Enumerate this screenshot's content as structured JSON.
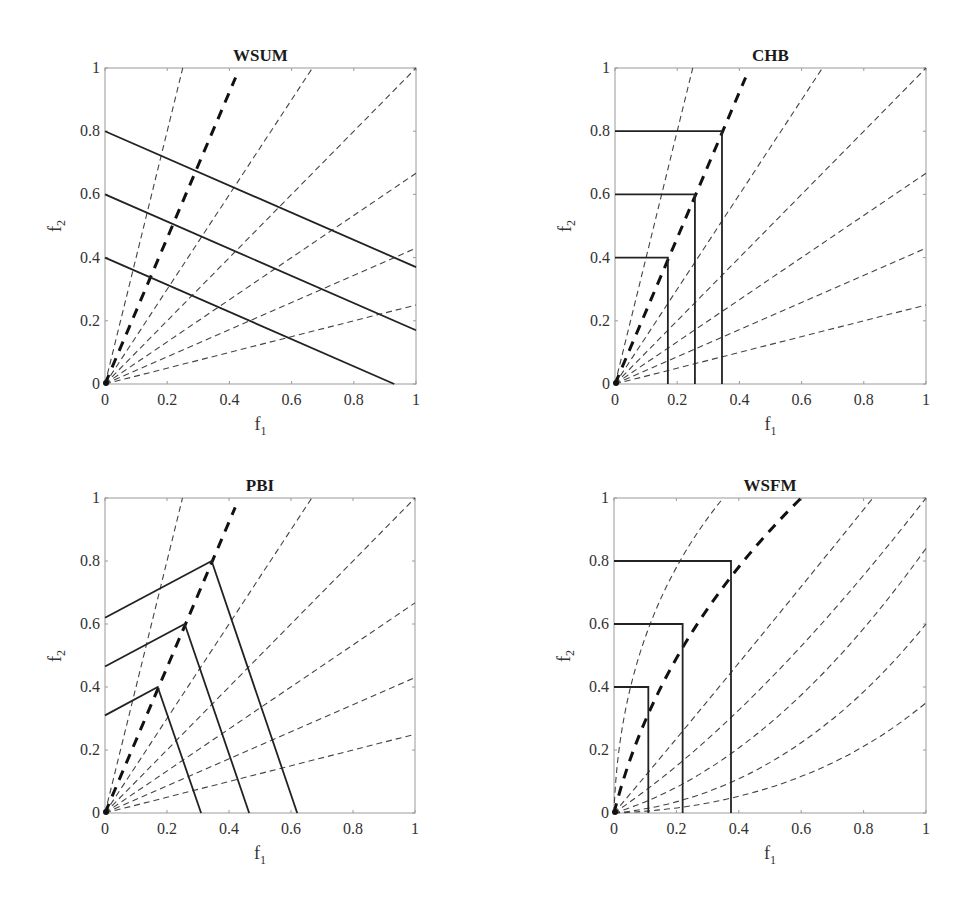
{
  "chart_data": [
    {
      "type": "line",
      "title": "WSUM",
      "xlabel": "f",
      "xlabel_sub": "1",
      "ylabel": "f",
      "ylabel_sub": "2",
      "xlim": [
        0,
        1
      ],
      "ylim": [
        0,
        1
      ],
      "xticks": [
        "0",
        "0.2",
        "0.4",
        "0.6",
        "0.8",
        "1"
      ],
      "yticks": [
        "0",
        "0.2",
        "0.4",
        "0.6",
        "0.8",
        "1"
      ],
      "grid": false,
      "rays_thin": [
        [
          0.25,
          1.0
        ],
        [
          0.667,
          1.0
        ],
        [
          1.0,
          1.0
        ],
        [
          1.0,
          0.667
        ],
        [
          1.0,
          0.43
        ],
        [
          1.0,
          0.25
        ]
      ],
      "ray_bold": [
        0.42,
        0.97
      ],
      "contours": [
        [
          [
            0,
            0.8
          ],
          [
            1.0,
            0.37
          ]
        ],
        [
          [
            0,
            0.6
          ],
          [
            1.0,
            0.17
          ]
        ],
        [
          [
            0,
            0.4
          ],
          [
            0.93,
            0.0
          ]
        ]
      ]
    },
    {
      "type": "line",
      "title": "CHB",
      "xlabel": "f",
      "xlabel_sub": "1",
      "ylabel": "f",
      "ylabel_sub": "2",
      "xlim": [
        0,
        1
      ],
      "ylim": [
        0,
        1
      ],
      "xticks": [
        "0",
        "0.2",
        "0.4",
        "0.6",
        "0.8",
        "1"
      ],
      "yticks": [
        "0",
        "0.2",
        "0.4",
        "0.6",
        "0.8",
        "1"
      ],
      "grid": false,
      "rays_thin": [
        [
          0.25,
          1.0
        ],
        [
          0.667,
          1.0
        ],
        [
          1.0,
          1.0
        ],
        [
          1.0,
          0.667
        ],
        [
          1.0,
          0.43
        ],
        [
          1.0,
          0.25
        ]
      ],
      "ray_bold": [
        0.42,
        0.97
      ],
      "contours": [
        [
          [
            0,
            0.8
          ],
          [
            0.344,
            0.8
          ],
          [
            0.344,
            0.0
          ]
        ],
        [
          [
            0,
            0.6
          ],
          [
            0.257,
            0.6
          ],
          [
            0.257,
            0.0
          ]
        ],
        [
          [
            0,
            0.4
          ],
          [
            0.17,
            0.4
          ],
          [
            0.17,
            0.0
          ]
        ]
      ]
    },
    {
      "type": "line",
      "title": "PBI",
      "xlabel": "f",
      "xlabel_sub": "1",
      "ylabel": "f",
      "ylabel_sub": "2",
      "xlim": [
        0,
        1
      ],
      "ylim": [
        0,
        1
      ],
      "xticks": [
        "0",
        "0.2",
        "0.4",
        "0.6",
        "0.8",
        "1"
      ],
      "yticks": [
        "0",
        "0.2",
        "0.4",
        "0.6",
        "0.8",
        "1"
      ],
      "grid": false,
      "rays_thin": [
        [
          0.25,
          1.0
        ],
        [
          0.667,
          1.0
        ],
        [
          1.0,
          1.0
        ],
        [
          1.0,
          0.667
        ],
        [
          1.0,
          0.43
        ],
        [
          1.0,
          0.25
        ]
      ],
      "ray_bold": [
        0.42,
        0.97
      ],
      "contours": [
        [
          [
            0,
            0.62
          ],
          [
            0.344,
            0.8
          ],
          [
            0.62,
            0.0
          ]
        ],
        [
          [
            0,
            0.465
          ],
          [
            0.257,
            0.6
          ],
          [
            0.465,
            0.0
          ]
        ],
        [
          [
            0,
            0.31
          ],
          [
            0.17,
            0.4
          ],
          [
            0.31,
            0.0
          ]
        ]
      ]
    },
    {
      "type": "line",
      "title": "WSFM",
      "xlabel": "f",
      "xlabel_sub": "1",
      "ylabel": "f",
      "ylabel_sub": "2",
      "xlim": [
        0,
        1
      ],
      "ylim": [
        0,
        1
      ],
      "xticks": [
        "0",
        "0.2",
        "0.4",
        "0.6",
        "0.8",
        "1"
      ],
      "yticks": [
        "0",
        "0.2",
        "0.4",
        "0.6",
        "0.8",
        "1"
      ],
      "grid": false,
      "curves_thin": [
        [
          [
            0,
            0
          ],
          [
            0.02,
            0.6
          ],
          [
            0.35,
            1.0
          ]
        ],
        [
          [
            0,
            0
          ],
          [
            0.3,
            0.35
          ],
          [
            0.83,
            1.0
          ]
        ],
        [
          [
            0,
            0
          ],
          [
            0.45,
            0.3
          ],
          [
            1.0,
            1.0
          ]
        ],
        [
          [
            0,
            0
          ],
          [
            0.5,
            0.15
          ],
          [
            1.0,
            0.84
          ]
        ],
        [
          [
            0,
            0
          ],
          [
            0.55,
            0.05
          ],
          [
            1.0,
            0.6
          ]
        ],
        [
          [
            0,
            0
          ],
          [
            0.6,
            0.02
          ],
          [
            1.0,
            0.35
          ]
        ]
      ],
      "curve_bold": [
        [
          0,
          0
        ],
        [
          0.14,
          0.55
        ],
        [
          0.6,
          1.0
        ]
      ],
      "contours": [
        [
          [
            0,
            0.8
          ],
          [
            0.375,
            0.8
          ],
          [
            0.375,
            0.0
          ]
        ],
        [
          [
            0,
            0.6
          ],
          [
            0.22,
            0.6
          ],
          [
            0.22,
            0.0
          ]
        ],
        [
          [
            0,
            0.4
          ],
          [
            0.11,
            0.4
          ],
          [
            0.11,
            0.0
          ]
        ]
      ]
    }
  ],
  "panels": [
    {
      "title": "WSUM"
    },
    {
      "title": "CHB"
    },
    {
      "title": "PBI"
    },
    {
      "title": "WSFM"
    }
  ]
}
